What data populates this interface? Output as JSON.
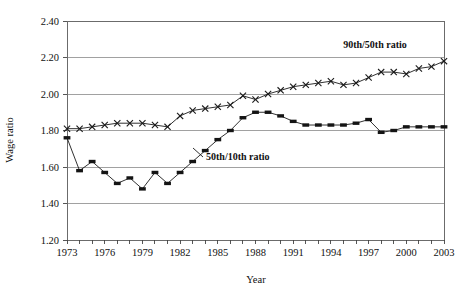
{
  "chart_data": {
    "type": "line",
    "title": "",
    "xlabel": "Year",
    "ylabel": "Wage ratio",
    "xlim": [
      1973,
      2003
    ],
    "ylim": [
      1.2,
      2.4
    ],
    "yticks": [
      1.2,
      1.4,
      1.6,
      1.8,
      2.0,
      2.2,
      2.4
    ],
    "ytick_labels": [
      "1.20",
      "1.40",
      "1.60",
      "1.80",
      "2.00",
      "2.20",
      "2.40"
    ],
    "xticks": [
      1973,
      1974,
      1975,
      1976,
      1977,
      1978,
      1979,
      1980,
      1981,
      1982,
      1983,
      1984,
      1985,
      1986,
      1987,
      1988,
      1989,
      1990,
      1991,
      1992,
      1993,
      1994,
      1995,
      1996,
      1997,
      1998,
      1999,
      2000,
      2001,
      2002,
      2003
    ],
    "xtick_labels": [
      "1973",
      "",
      "",
      "1976",
      "",
      "",
      "1979",
      "",
      "",
      "1982",
      "",
      "",
      "1985",
      "",
      "",
      "1988",
      "",
      "",
      "1991",
      "",
      "",
      "1994",
      "",
      "",
      "1997",
      "",
      "",
      "2000",
      "",
      "",
      "2003"
    ],
    "grid": true,
    "legend_position": "inline-annotation",
    "x": [
      1973,
      1974,
      1975,
      1976,
      1977,
      1978,
      1979,
      1980,
      1981,
      1982,
      1983,
      1984,
      1985,
      1986,
      1987,
      1988,
      1989,
      1990,
      1991,
      1992,
      1993,
      1994,
      1995,
      1996,
      1997,
      1998,
      1999,
      2000,
      2001,
      2002,
      2003
    ],
    "series": [
      {
        "name": "90th/50th ratio",
        "marker": "x",
        "label_text": "90th/50th ratio",
        "values": [
          1.81,
          1.81,
          1.82,
          1.83,
          1.84,
          1.84,
          1.84,
          1.83,
          1.82,
          1.88,
          1.91,
          1.92,
          1.93,
          1.94,
          1.99,
          1.97,
          2.0,
          2.02,
          2.04,
          2.05,
          2.06,
          2.07,
          2.05,
          2.06,
          2.09,
          2.12,
          2.12,
          2.11,
          2.14,
          2.15,
          2.18
        ]
      },
      {
        "name": "50th/10th ratio",
        "marker": "square",
        "label_text": "50th/10th ratio",
        "values": [
          1.76,
          1.58,
          1.63,
          1.57,
          1.51,
          1.54,
          1.48,
          1.57,
          1.51,
          1.57,
          1.63,
          1.69,
          1.75,
          1.8,
          1.87,
          1.9,
          1.9,
          1.88,
          1.85,
          1.83,
          1.83,
          1.83,
          1.83,
          1.84,
          1.86,
          1.79,
          1.8,
          1.82,
          1.82,
          1.82,
          1.82
        ]
      }
    ]
  },
  "annotations": {
    "series_90_50_label": "90th/50th ratio",
    "series_50_10_label": "50th/10th ratio"
  },
  "axes": {
    "y_title": "Wage ratio",
    "x_title": "Year"
  }
}
